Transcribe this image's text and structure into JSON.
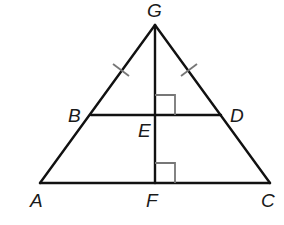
{
  "diagram": {
    "type": "geometry",
    "points": {
      "G": {
        "label": "G",
        "x": 155,
        "y": 25,
        "lx": 147,
        "ly": 17
      },
      "B": {
        "label": "B",
        "x": 91,
        "y": 115,
        "lx": 68,
        "ly": 122
      },
      "D": {
        "label": "D",
        "x": 221,
        "y": 115,
        "lx": 230,
        "ly": 122
      },
      "E": {
        "label": "E",
        "x": 155,
        "y": 115,
        "lx": 138,
        "ly": 137
      },
      "A": {
        "label": "A",
        "x": 40,
        "y": 183,
        "lx": 30,
        "ly": 207
      },
      "F": {
        "label": "F",
        "x": 155,
        "y": 183,
        "lx": 146,
        "ly": 207
      },
      "C": {
        "label": "C",
        "x": 270,
        "y": 183,
        "lx": 261,
        "ly": 207
      }
    },
    "segments": [
      {
        "from": "G",
        "to": "A"
      },
      {
        "from": "G",
        "to": "C"
      },
      {
        "from": "A",
        "to": "C"
      },
      {
        "from": "B",
        "to": "D"
      },
      {
        "from": "G",
        "to": "F"
      }
    ],
    "congruence_marks": [
      {
        "segment": "GB",
        "count": 1
      },
      {
        "segment": "GD",
        "count": 1
      }
    ],
    "right_angles": [
      {
        "vertex": "E",
        "between": [
          "G",
          "D"
        ]
      },
      {
        "vertex": "F",
        "between": [
          "G",
          "C"
        ]
      }
    ],
    "colors": {
      "line": "#111111",
      "mark": "#777777",
      "label": "#1a1a1a",
      "background": "#ffffff"
    }
  }
}
